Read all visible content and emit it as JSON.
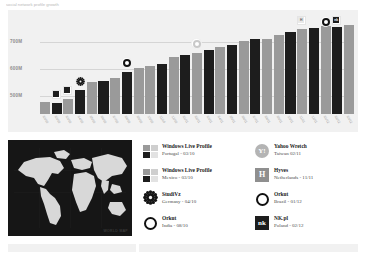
{
  "top_caption": "social network profile growth",
  "chart": {
    "y_ticks": [
      "700M",
      "600M",
      "500M"
    ],
    "watermark": "WORLD MAP"
  },
  "chart_data": {
    "type": "bar",
    "title": "",
    "xlabel": "",
    "ylabel": "",
    "ylim": [
      400,
      830
    ],
    "grid": true,
    "legend_position": "below",
    "categories": [
      "03/10",
      "03/10",
      "03/10",
      "04/10",
      "05/10",
      "06/10",
      "07/10",
      "08/10",
      "09/10",
      "10/10",
      "11/10",
      "12/10",
      "01/11",
      "02/11",
      "03/11",
      "04/11",
      "05/11",
      "06/11",
      "07/11",
      "08/11",
      "09/11",
      "10/11",
      "11/11",
      "12/11",
      "01/12",
      "02/12",
      "03/12"
    ],
    "values": [
      452,
      448,
      468,
      505,
      540,
      545,
      560,
      585,
      600,
      612,
      620,
      648,
      660,
      668,
      682,
      695,
      705,
      720,
      728,
      730,
      745,
      758,
      772,
      778,
      788,
      782,
      790
    ],
    "bar_shades": [
      "light",
      "dark",
      "light",
      "dark",
      "light",
      "dark",
      "light",
      "dark",
      "light",
      "light",
      "dark",
      "light",
      "dark",
      "light",
      "dark",
      "light",
      "dark",
      "light",
      "dark",
      "light",
      "light",
      "dark",
      "light",
      "dark",
      "light",
      "dark",
      "light"
    ],
    "markers": [
      {
        "bar_index": 1,
        "icon": "square-dark-icon",
        "label": "Windows Live Profile"
      },
      {
        "bar_index": 2,
        "icon": "square-dark-icon",
        "label": "Windows Live Profile"
      },
      {
        "bar_index": 3,
        "icon": "gear-icon",
        "label": "StudiVz"
      },
      {
        "bar_index": 7,
        "icon": "ring-icon",
        "label": "Orkut"
      },
      {
        "bar_index": 13,
        "icon": "yahoo-icon",
        "label": "Yahoo Wretch"
      },
      {
        "bar_index": 22,
        "icon": "hyves-icon",
        "label": "Hyves"
      },
      {
        "bar_index": 24,
        "icon": "ring-icon",
        "label": "Orkut"
      },
      {
        "bar_index": 25,
        "icon": "nk-icon",
        "label": "NK.pl"
      }
    ]
  },
  "legend": {
    "items": [
      {
        "icon": "swatches-icon",
        "title": "Windows Live Profile",
        "subtitle": "Portugal - 03/10"
      },
      {
        "icon": "yahoo-icon",
        "title": "Yahoo Wretch",
        "subtitle": "Taiwan 02/11"
      },
      {
        "icon": "swatches-icon",
        "title": "Windows Live Profile",
        "subtitle": "Mexico - 03/10"
      },
      {
        "icon": "hyves-icon",
        "title": "Hyves",
        "subtitle": "Netherlands - 11/11"
      },
      {
        "icon": "gear-icon",
        "title": "StudiVz",
        "subtitle": "Germany - 04/10"
      },
      {
        "icon": "ring-icon",
        "title": "Orkut",
        "subtitle": "Brazil - 01/12"
      },
      {
        "icon": "ring-icon",
        "title": "Orkut",
        "subtitle": "India - 08/10"
      },
      {
        "icon": "nk-icon",
        "title": "NK.pl",
        "subtitle": "Poland - 02/12"
      }
    ],
    "icon_glyphs": {
      "yahoo": "Y",
      "hyves": "H",
      "nk": "nk"
    }
  }
}
